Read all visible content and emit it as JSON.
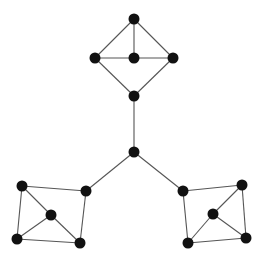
{
  "graph": {
    "node_color": "#111111",
    "edge_color": "#555555",
    "node_radius": 5.5,
    "nodes": [
      {
        "id": "hub",
        "x": 134,
        "y": 152
      },
      {
        "id": "top-top",
        "x": 134,
        "y": 19
      },
      {
        "id": "top-left",
        "x": 95,
        "y": 58
      },
      {
        "id": "top-center",
        "x": 134,
        "y": 58
      },
      {
        "id": "top-right",
        "x": 173,
        "y": 58
      },
      {
        "id": "top-bottom",
        "x": 134,
        "y": 96
      },
      {
        "id": "left-tl",
        "x": 22,
        "y": 186
      },
      {
        "id": "left-tr",
        "x": 86,
        "y": 191
      },
      {
        "id": "left-center",
        "x": 51,
        "y": 215
      },
      {
        "id": "left-bl",
        "x": 17,
        "y": 239
      },
      {
        "id": "left-br",
        "x": 80,
        "y": 243
      },
      {
        "id": "right-tl",
        "x": 183,
        "y": 191
      },
      {
        "id": "right-tr",
        "x": 242,
        "y": 185
      },
      {
        "id": "right-center",
        "x": 213,
        "y": 214
      },
      {
        "id": "right-bl",
        "x": 188,
        "y": 243
      },
      {
        "id": "right-br",
        "x": 246,
        "y": 238
      }
    ],
    "edges": [
      [
        "top-top",
        "top-left"
      ],
      [
        "top-top",
        "top-center"
      ],
      [
        "top-top",
        "top-right"
      ],
      [
        "top-left",
        "top-center"
      ],
      [
        "top-center",
        "top-right"
      ],
      [
        "top-left",
        "top-bottom"
      ],
      [
        "top-right",
        "top-bottom"
      ],
      [
        "top-bottom",
        "hub"
      ],
      [
        "hub",
        "left-tr"
      ],
      [
        "hub",
        "right-tl"
      ],
      [
        "left-tl",
        "left-tr"
      ],
      [
        "left-tl",
        "left-bl"
      ],
      [
        "left-bl",
        "left-br"
      ],
      [
        "left-tr",
        "left-br"
      ],
      [
        "left-tl",
        "left-center"
      ],
      [
        "left-center",
        "left-bl"
      ],
      [
        "left-center",
        "left-br"
      ],
      [
        "right-tl",
        "right-tr"
      ],
      [
        "right-tl",
        "right-bl"
      ],
      [
        "right-bl",
        "right-br"
      ],
      [
        "right-tr",
        "right-br"
      ],
      [
        "right-tr",
        "right-center"
      ],
      [
        "right-center",
        "right-bl"
      ],
      [
        "right-center",
        "right-br"
      ]
    ]
  }
}
